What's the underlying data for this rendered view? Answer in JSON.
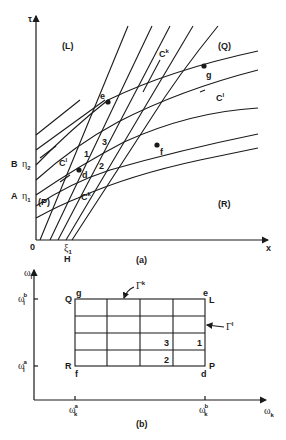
{
  "figure_a": {
    "caption": "(a)",
    "axes": {
      "y_label": "τ",
      "x_label": "x",
      "origin": "0"
    },
    "regions": {
      "L": "(L)",
      "Q": "(Q)",
      "P": "(P)",
      "R": "(R)"
    },
    "curve_labels": {
      "ck_top": "C",
      "ck_top_sup": "k",
      "cl_right": "C",
      "cl_right_sup": "l",
      "cl_left": "C",
      "cl_left_sup": "l",
      "ck_bottom": "C",
      "ck_bottom_sup": "k"
    },
    "points": {
      "e": "e",
      "g": "g",
      "d": "d",
      "f": "f"
    },
    "cells": {
      "c1": "1",
      "c2": "2",
      "c3": "3"
    },
    "y_ticks": {
      "B": "B",
      "eta2": "η",
      "eta2_sub": "2",
      "A": "A",
      "eta1": "η",
      "eta1_sub": "1"
    },
    "x_ticks": {
      "xi1": "ξ",
      "xi1_sub": "1",
      "H": "H"
    }
  },
  "figure_b": {
    "caption": "(b)",
    "axes": {
      "y_label": "ω",
      "y_sub": "l",
      "x_label": "ω",
      "x_sub": "k"
    },
    "y_ticks": [
      {
        "base": "ω",
        "sub": "l",
        "sup": "b"
      },
      {
        "base": "ω",
        "sub": "l",
        "sup": "a"
      }
    ],
    "x_ticks": [
      {
        "base": "ω",
        "sub": "k",
        "sup": "a"
      },
      {
        "base": "ω",
        "sub": "k",
        "sup": "b"
      }
    ],
    "corners": {
      "Q": "Q",
      "g": "g",
      "e": "e",
      "L": "L",
      "R": "R",
      "f": "f",
      "d": "d",
      "P": "P"
    },
    "boundary_labels": {
      "gamma_k": "Γ",
      "gamma_k_sup": "k",
      "gamma_l": "Γ",
      "gamma_l_sup": "l"
    },
    "cells": {
      "c3": "3",
      "c1": "1",
      "c2": "2"
    },
    "grid": {
      "columns": 4,
      "rows": 4
    }
  }
}
